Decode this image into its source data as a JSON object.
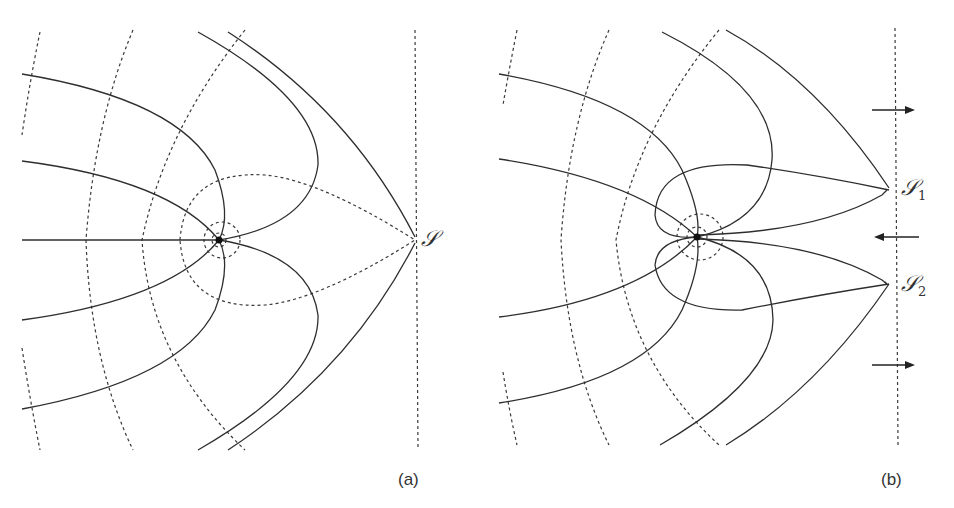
{
  "figure": {
    "panels": [
      {
        "id": "a",
        "caption": "(a)",
        "singular_point_label": "𝒮",
        "description": "Solid field lines from a source point with dashed equipotential contours converging to a single point S on a vertical dashed boundary"
      },
      {
        "id": "b",
        "caption": "(b)",
        "singular_point_labels": [
          "𝒮",
          "𝒮"
        ],
        "singular_point_subscripts": [
          "1",
          "2"
        ],
        "arrows": [
          "right",
          "left",
          "right"
        ],
        "description": "Solid field lines from a source point; flow splits into two singular points S1 and S2 on a vertical dashed boundary with flow arrows"
      }
    ]
  }
}
